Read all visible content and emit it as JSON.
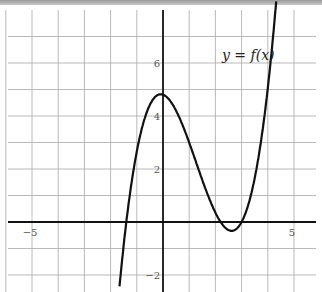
{
  "chart_data": {
    "type": "line",
    "title": "",
    "xlabel": "",
    "ylabel": "",
    "xlim": [
      -6,
      5.9
    ],
    "ylim": [
      -2.7,
      8.1
    ],
    "grid": true,
    "x_ticks": [
      {
        "value": -5,
        "label": "−5"
      },
      {
        "value": 5,
        "label": "5"
      }
    ],
    "y_ticks": [
      {
        "value": -2,
        "label": "−2"
      },
      {
        "value": 2,
        "label": "2"
      },
      {
        "value": 4,
        "label": "4"
      },
      {
        "value": 6,
        "label": "6"
      }
    ],
    "annotations": [
      {
        "text": "y = f(x)",
        "x": 3.6,
        "y": 6.8
      }
    ],
    "series": [
      {
        "name": "y = f(x)",
        "description": "cubic with roots near -1.4, 2.2, 3.0; local max ~4.8 at x=0, local min ~-0.3 at x~2.6",
        "x": [
          -1.64,
          -1.4,
          -1.0,
          -0.5,
          0,
          0.5,
          1.0,
          1.5,
          2.0,
          2.2,
          2.6,
          3.0,
          3.5,
          4.0,
          4.3
        ],
        "y": [
          -2.7,
          0,
          2.72,
          4.27,
          4.8,
          4.4,
          3.4,
          2.06,
          0.6,
          0,
          -0.33,
          0,
          1.47,
          5.05,
          8.1
        ]
      }
    ]
  }
}
